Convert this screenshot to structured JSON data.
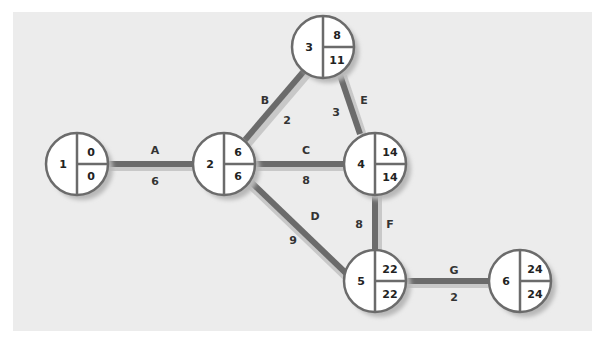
{
  "diagram": {
    "type": "activity-on-node network (critical path)",
    "colors": {
      "background": "#ececec",
      "edge": "#6b6b6b",
      "edge_shadow": "#c4c4c4",
      "node_fill": "#ffffff",
      "node_stroke": "#6b6b6b",
      "text": "#222222"
    },
    "nodes": [
      {
        "id": "1",
        "x": 77,
        "y": 164,
        "earliest": "0",
        "latest": "0"
      },
      {
        "id": "2",
        "x": 224,
        "y": 164,
        "earliest": "6",
        "latest": "6"
      },
      {
        "id": "3",
        "x": 325,
        "y": 47,
        "earliest": "8",
        "latest": "11"
      },
      {
        "id": "4",
        "x": 375,
        "y": 164,
        "earliest": "14",
        "latest": "14"
      },
      {
        "id": "5",
        "x": 375,
        "y": 298,
        "earliest": "22",
        "latest": "22"
      },
      {
        "id": "6",
        "x": 520,
        "y": 285,
        "earliest": "24",
        "latest": "24"
      }
    ],
    "edges": [
      {
        "activity": "A",
        "duration": "6",
        "from": "1",
        "to": "2"
      },
      {
        "activity": "B",
        "duration": "2",
        "from": "2",
        "to": "3"
      },
      {
        "activity": "C",
        "duration": "8",
        "from": "2",
        "to": "4"
      },
      {
        "activity": "D",
        "duration": "9",
        "from": "2",
        "to": "5"
      },
      {
        "activity": "E",
        "duration": "3",
        "from": "3",
        "to": "4"
      },
      {
        "activity": "F",
        "duration": "8",
        "from": "4",
        "to": "5"
      },
      {
        "activity": "G",
        "duration": "2",
        "from": "5",
        "to": "6"
      }
    ]
  }
}
